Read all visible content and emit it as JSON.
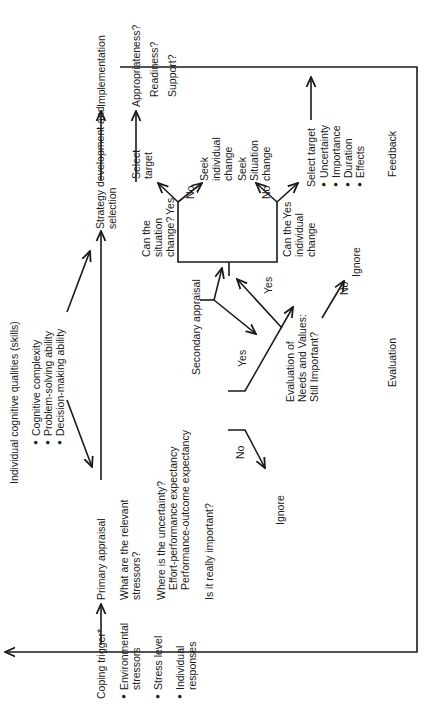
{
  "diagram": {
    "type": "flowchart",
    "orientation": "rotated-90-ccw",
    "nodes": {
      "coping_trigger": "Coping trigger*",
      "trigger_factors": [
        "Environmental stressors",
        "Stress level",
        "Individual responses"
      ],
      "primary_appraisal": "Primary appraisal",
      "primary_q1": "What are the relevant stressors?",
      "primary_q2": "Where is the uncertainty?",
      "primary_q2_items": [
        "Effort-performance expectancy",
        "Performance-outcome expectancy"
      ],
      "primary_q3": "Is it really important?",
      "cognitive_qualities_title": "Individual cognitive qualities (skills)",
      "cognitive_qualities": [
        "Cognitive complexity",
        "Problem-solving ability",
        "Decision-making ability"
      ],
      "secondary_appraisal": "Secondary appraisal",
      "evaluation_needs": "Evaluation of Needs and Values: Still Important?",
      "can_situation_change": "Can the situation change?",
      "can_individual_change": "Can the individual change",
      "select_target_1": "Select target",
      "seek_individual_change": "Seek individual change",
      "seek_situation_change": "Seek Situation change",
      "select_target_2": "Select target",
      "target_criteria": [
        "Uncertainty",
        "Importance",
        "Duration",
        "Effects"
      ],
      "strategy_development": "Strategy development and selection",
      "implementation": "Implementation",
      "implementation_checks": [
        "Appropriateness?",
        "Readiness?",
        "Support?"
      ],
      "ignore": "Ignore",
      "evaluation": "Evaluation",
      "feedback": "Feedback"
    },
    "edge_labels": {
      "yes": "Yes",
      "no": "No"
    }
  }
}
